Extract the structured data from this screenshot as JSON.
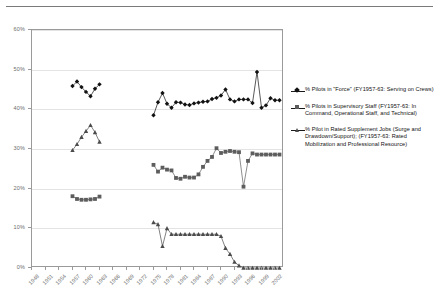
{
  "chart_data": {
    "type": "line",
    "title": "",
    "subtitle": "",
    "xlabel": "",
    "ylabel": "",
    "ylim": [
      0,
      60
    ],
    "yunit": "%",
    "ytick_labels": [
      "0%",
      "10%",
      "20%",
      "30%",
      "40%",
      "50%",
      "60%"
    ],
    "ytick_values": [
      0,
      10,
      20,
      30,
      40,
      50,
      60
    ],
    "grid": true,
    "grid_axis": "y",
    "legend_position": "right",
    "xlim": [
      1948,
      2004
    ],
    "xtick_labels": [
      "1948",
      "1951",
      "1954",
      "1957",
      "1960",
      "1963",
      "1966",
      "1969",
      "1972",
      "1975",
      "1978",
      "1981",
      "1984",
      "1987",
      "1990",
      "1993",
      "1996",
      "1999",
      "2002"
    ],
    "xtick_values": [
      1948,
      1951,
      1954,
      1957,
      1960,
      1963,
      1966,
      1969,
      1972,
      1975,
      1978,
      1981,
      1984,
      1987,
      1990,
      1993,
      1996,
      1999,
      2002
    ],
    "series": [
      {
        "name": "% Pilots in \"Force\" (FY1957-63:  Serving on Crews)",
        "marker": "diamond",
        "color": "#111111",
        "segments": [
          {
            "x": [
              1957,
              1958,
              1959,
              1960,
              1961,
              1962,
              1963
            ],
            "y": [
              45.9,
              47.0,
              45.6,
              44.4,
              43.3,
              45.2,
              46.3
            ]
          },
          {
            "x": [
              1975,
              1976,
              1977,
              1978,
              1979,
              1980,
              1981,
              1982,
              1983,
              1984,
              1985,
              1986,
              1987,
              1988,
              1989,
              1990,
              1991,
              1992,
              1993,
              1994,
              1995,
              1996,
              1997,
              1998,
              1999,
              2000,
              2001,
              2002,
              2003
            ],
            "y": [
              38.5,
              41.8,
              44.1,
              41.4,
              40.4,
              41.8,
              41.7,
              41.2,
              41.1,
              41.5,
              41.7,
              41.9,
              42.0,
              42.6,
              42.9,
              43.5,
              45.0,
              42.5,
              42.0,
              42.5,
              42.5,
              42.5,
              41.6,
              49.4,
              40.4,
              41.0,
              42.8,
              42.3,
              42.3
            ]
          }
        ]
      },
      {
        "name": "% Pilots in Supervisory Staff (FY1957-63: In Command, Operational Staff, and Technical)",
        "marker": "square",
        "color": "#5d5d5d",
        "segments": [
          {
            "x": [
              1957,
              1958,
              1959,
              1960,
              1961,
              1962,
              1963
            ],
            "y": [
              18.1,
              17.4,
              17.2,
              17.2,
              17.3,
              17.4,
              18.0
            ]
          },
          {
            "x": [
              1975,
              1976,
              1977,
              1978,
              1979,
              1980,
              1981,
              1982,
              1983,
              1984,
              1985,
              1986,
              1987,
              1988,
              1989,
              1990,
              1991,
              1992,
              1993,
              1994,
              1995,
              1996,
              1997,
              1998,
              1999,
              2000,
              2001,
              2002,
              2003
            ],
            "y": [
              26.0,
              24.3,
              25.3,
              24.8,
              24.6,
              22.7,
              22.5,
              23.0,
              22.8,
              22.8,
              23.6,
              25.5,
              27.0,
              28.0,
              30.2,
              29.0,
              29.3,
              29.5,
              29.3,
              29.2,
              20.5,
              27.0,
              28.9,
              28.6,
              28.6,
              28.6,
              28.6,
              28.6,
              28.6
            ]
          }
        ]
      },
      {
        "name": "% Pilot in Rated Supplement Jobs (Surge and Drawdown/Support); (FY1957-63: Rated Mobilization and Professional Resource)",
        "marker": "triangle",
        "color": "#4b4b4b",
        "segments": [
          {
            "x": [
              1957,
              1958,
              1959,
              1960,
              1961,
              1962,
              1963
            ],
            "y": [
              29.7,
              31.2,
              33.0,
              34.5,
              36.0,
              34.2,
              31.8
            ]
          },
          {
            "x": [
              1975,
              1976,
              1977,
              1978,
              1979,
              1980,
              1981,
              1982,
              1983,
              1984,
              1985,
              1986,
              1987,
              1988,
              1989,
              1990,
              1991,
              1992,
              1993,
              1994,
              1995,
              1996,
              1997,
              1998,
              1999,
              2000,
              2001,
              2002,
              2003
            ],
            "y": [
              11.5,
              11.0,
              5.5,
              10.0,
              8.5,
              8.5,
              8.5,
              8.5,
              8.5,
              8.5,
              8.5,
              8.5,
              8.5,
              8.5,
              8.5,
              8.0,
              5.0,
              3.5,
              1.5,
              0.6,
              0.0,
              0.0,
              0.0,
              0.0,
              0.0,
              0.0,
              0.0,
              0.0,
              0.0
            ]
          }
        ]
      }
    ]
  },
  "legend": {
    "entries": [
      {
        "marker": "diamond-marker",
        "label": "% Pilots in \"Force\" (FY1957-63:  Serving on Crews)"
      },
      {
        "marker": "square-marker",
        "label": "% Pilots in Supervisory Staff (FY1957-63: In Command, Operational Staff, and Technical)"
      },
      {
        "marker": "triangle-marker",
        "label": "% Pilot in Rated Supplement Jobs (Surge and Drawdown/Support); (FY1957-63: Rated Mobilization and Professional Resource)"
      }
    ]
  }
}
